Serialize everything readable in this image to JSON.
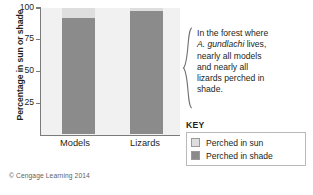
{
  "figure": {
    "copyright": "© Cengage Learning 2014"
  },
  "annotation": {
    "line1": "In the forest where",
    "species": "A. gundlachi",
    "line2_rest": " lives,",
    "line3": "nearly all models",
    "line4": "and nearly all",
    "line5": "lizards perched in",
    "line6": "shade.",
    "brace_icon": "curly-brace-icon"
  },
  "key": {
    "title": "KEY",
    "items": [
      {
        "label": "Perched in sun",
        "color": "#dedede"
      },
      {
        "label": "Perched in shade",
        "color": "#8b8b8b"
      }
    ]
  },
  "chart_data": {
    "type": "bar",
    "stacked": true,
    "title": "",
    "xlabel": "",
    "ylabel": "Percentage in sun or shade",
    "categories": [
      "Models",
      "Lizards"
    ],
    "ylim": [
      0,
      100
    ],
    "yticks": [
      25,
      50,
      75,
      100
    ],
    "ytick_labels": [
      "25",
      "50",
      "75",
      "100"
    ],
    "grid": false,
    "legend_position": "right",
    "series": [
      {
        "name": "Perched in shade",
        "color": "#8b8b8b",
        "values": [
          92,
          98
        ]
      },
      {
        "name": "Perched in sun",
        "color": "#dedede",
        "values": [
          8,
          2
        ]
      }
    ]
  }
}
